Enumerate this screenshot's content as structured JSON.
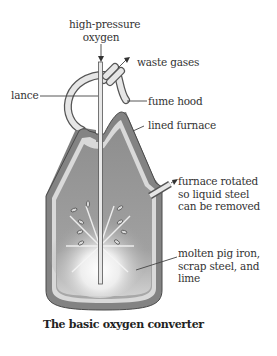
{
  "diagram": {
    "title": "The basic oxygen converter",
    "labels": {
      "oxygen": [
        "high-pressure",
        "oxygen"
      ],
      "waste_gases": "waste gases",
      "lance": "lance",
      "fume_hood": "fume hood",
      "lined_furnace": "lined furnace",
      "rotated": [
        "furnace rotated",
        "so liquid steel",
        "can be removed"
      ],
      "molten": [
        "molten pig iron,",
        "scrap steel, and",
        "lime"
      ]
    },
    "colors": {
      "shell": "#8a8a8a",
      "lining": "#d8d8d8",
      "interior": "#9a9a9a",
      "molten": "#a8a8a8",
      "line": "#444444"
    }
  }
}
